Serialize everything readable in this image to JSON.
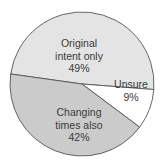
{
  "chart_data": {
    "type": "pie",
    "title": "",
    "categories": [
      "Original intent only",
      "Unsure",
      "Changing times also"
    ],
    "values": [
      49,
      9,
      42
    ],
    "unit": "%",
    "colors": [
      "#e4e4e4",
      "#ffffff",
      "#cbcbcb"
    ],
    "edge_color": "#555555",
    "legend": "none",
    "labels": [
      {
        "lines": [
          "Original",
          "intent only",
          "49%"
        ]
      },
      {
        "lines": [
          "Unsure",
          "9%"
        ]
      },
      {
        "lines": [
          "Changing",
          "times also",
          "42%"
        ]
      }
    ]
  }
}
